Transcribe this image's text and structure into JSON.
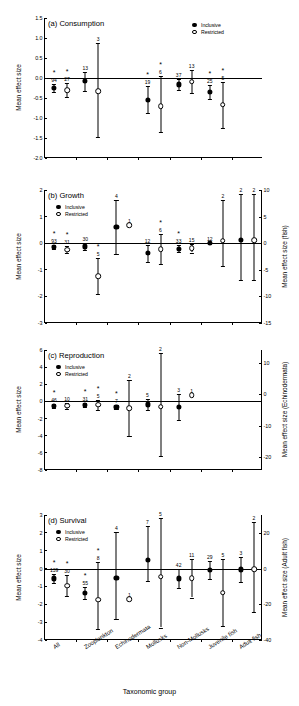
{
  "figure": {
    "xaxis_title": "Taxonomic group",
    "categories": [
      "All",
      "Zooplankton",
      "Echinodermata",
      "Mollusks",
      "Non-Mollusks",
      "Juvenile fish",
      "Adult fish"
    ],
    "legend": {
      "filled_label": "Inclusive",
      "open_label": "Restricted"
    },
    "left_axis_label": "Mean effect size",
    "significance_marker": "*"
  },
  "chart_data": [
    {
      "type": "scatter",
      "panel": "a",
      "title": "(a) Consumption",
      "ylabel": "Mean effect size",
      "xlabel": "",
      "ylim": [
        -2.0,
        1.5
      ],
      "yticks": [
        "1.5",
        "1.0",
        "0.5",
        "0.0",
        "-0.5",
        "-1.0",
        "-1.5",
        "-2.0"
      ],
      "ytick_values": [
        1.5,
        1.0,
        0.5,
        0.0,
        -0.5,
        -1.0,
        -1.5,
        -2.0
      ],
      "right_axis": null,
      "grid": false,
      "legend_position": "top-right",
      "categories": [
        "All",
        "Zooplankton",
        "Echinodermata",
        "Mollusks",
        "Non-Mollusks",
        "Juvenile fish",
        "Adult fish"
      ],
      "series": [
        {
          "name": "Inclusive",
          "marker": "filled",
          "points": [
            {
              "cat": "All",
              "value": -0.25,
              "low": -0.36,
              "high": -0.14,
              "n": "94",
              "sig": true
            },
            {
              "cat": "Zooplankton",
              "value": -0.08,
              "low": -0.33,
              "high": 0.16,
              "n": "13",
              "sig": false
            },
            {
              "cat": "Echinodermata",
              "value": null,
              "low": null,
              "high": null,
              "n": "",
              "sig": false
            },
            {
              "cat": "Mollusks",
              "value": -0.54,
              "low": -0.87,
              "high": -0.21,
              "n": "19",
              "sig": true
            },
            {
              "cat": "Non-Mollusks",
              "value": -0.16,
              "low": -0.3,
              "high": -0.02,
              "n": "37",
              "sig": false
            },
            {
              "cat": "Juvenile fish",
              "value": -0.35,
              "low": -0.53,
              "high": -0.17,
              "n": "25",
              "sig": true
            },
            {
              "cat": "Adult fish",
              "value": null,
              "low": null,
              "high": null,
              "n": "",
              "sig": false
            }
          ]
        },
        {
          "name": "Restricted",
          "marker": "open",
          "points": [
            {
              "cat": "All",
              "value": -0.3,
              "low": -0.48,
              "high": -0.12,
              "n": "27",
              "sig": true
            },
            {
              "cat": "Zooplankton",
              "value": -0.33,
              "low": -1.48,
              "high": 0.87,
              "n": "3",
              "sig": false
            },
            {
              "cat": "Echinodermata",
              "value": null,
              "low": null,
              "high": null,
              "n": "",
              "sig": false
            },
            {
              "cat": "Mollusks",
              "value": -0.7,
              "low": -1.36,
              "high": 0.04,
              "n": "6",
              "sig": true
            },
            {
              "cat": "Non-Mollusks",
              "value": -0.09,
              "low": -0.37,
              "high": 0.2,
              "n": "13",
              "sig": false
            },
            {
              "cat": "Juvenile fish",
              "value": -0.67,
              "low": -1.26,
              "high": -0.1,
              "n": "5",
              "sig": true
            },
            {
              "cat": "Adult fish",
              "value": null,
              "low": null,
              "high": null,
              "n": "",
              "sig": false
            }
          ]
        }
      ]
    },
    {
      "type": "scatter",
      "panel": "b",
      "title": "(b) Growth",
      "ylabel": "Mean effect size",
      "xlabel": "",
      "ylim": [
        -3,
        2
      ],
      "yticks": [
        "2",
        "1",
        "0",
        "-1",
        "-2",
        "-3"
      ],
      "ytick_values": [
        2,
        1,
        0,
        -1,
        -2,
        -3
      ],
      "right_axis": {
        "label": "Mean effect size (fish)",
        "ticks": [
          "10",
          "5",
          "0",
          "-5",
          "-10",
          "-15"
        ],
        "tick_values": [
          10,
          5,
          0,
          -5,
          -10,
          -15
        ],
        "lim": [
          -15,
          10
        ]
      },
      "grid": false,
      "legend_position": "top-left",
      "categories": [
        "All",
        "Zooplankton",
        "Echinodermata",
        "Mollusks",
        "Non-Mollusks",
        "Juvenile fish",
        "Adult fish"
      ],
      "series": [
        {
          "name": "Inclusive",
          "marker": "filled",
          "points": [
            {
              "cat": "All",
              "value": -0.13,
              "low": -0.21,
              "high": -0.05,
              "n": "93",
              "sig": true
            },
            {
              "cat": "Zooplankton",
              "value": -0.12,
              "low": -0.25,
              "high": 0.01,
              "n": "30",
              "sig": false
            },
            {
              "cat": "Echinodermata",
              "value": 0.62,
              "low": -0.4,
              "high": 1.64,
              "n": "4",
              "sig": false
            },
            {
              "cat": "Mollusks",
              "value": -0.38,
              "low": -0.71,
              "high": -0.05,
              "n": "12",
              "sig": false
            },
            {
              "cat": "Non-Mollusks",
              "value": -0.2,
              "low": -0.33,
              "high": -0.07,
              "n": "33",
              "sig": true
            },
            {
              "cat": "Juvenile fish",
              "value": 0.0,
              "low": 0.0,
              "high": 0.0,
              "n": "12",
              "sig": false
            },
            {
              "cat": "Adult fish",
              "value": 0.13,
              "low": -1.4,
              "high": 1.85,
              "n": "2",
              "sig": false
            }
          ]
        },
        {
          "name": "Restricted",
          "marker": "open",
          "points": [
            {
              "cat": "All",
              "value": -0.25,
              "low": -0.38,
              "high": -0.12,
              "n": "31",
              "sig": true
            },
            {
              "cat": "Zooplankton",
              "value": -1.24,
              "low": -1.9,
              "high": -0.55,
              "n": "5",
              "sig": true
            },
            {
              "cat": "Echinodermata",
              "value": 0.68,
              "low": 0.68,
              "high": 0.68,
              "n": "1",
              "sig": false
            },
            {
              "cat": "Mollusks",
              "value": -0.23,
              "low": -0.78,
              "high": 0.33,
              "n": "6",
              "sig": true
            },
            {
              "cat": "Non-Mollusks",
              "value": -0.18,
              "low": -0.35,
              "high": -0.02,
              "n": "15",
              "sig": false
            },
            {
              "cat": "Juvenile fish",
              "value": 0.1,
              "low": -0.85,
              "high": 1.62,
              "n": "2",
              "sig": false
            },
            {
              "cat": "Adult fish",
              "value": 0.12,
              "low": -1.4,
              "high": 1.85,
              "n": "2",
              "sig": false
            }
          ]
        }
      ]
    },
    {
      "type": "scatter",
      "panel": "c",
      "title": "(c) Reproduction",
      "ylabel": "Mean effect size",
      "xlabel": "",
      "ylim": [
        -8,
        6
      ],
      "yticks": [
        "6",
        "4",
        "2",
        "0",
        "-2",
        "-4",
        "-6",
        "-8"
      ],
      "ytick_values": [
        6,
        4,
        2,
        0,
        -2,
        -4,
        -6,
        -8
      ],
      "right_axis": {
        "label": "Mean effect size (Echinodermata)",
        "ticks": [
          "10",
          "0",
          "-10",
          "-20"
        ],
        "tick_values": [
          10,
          0,
          -10,
          -20
        ],
        "lim": [
          -24,
          14
        ]
      },
      "grid": false,
      "legend_position": "top-left",
      "categories": [
        "All",
        "Zooplankton",
        "Echinodermata",
        "Mollusks",
        "Non-Mollusks",
        "Juvenile fish",
        "Adult fish"
      ],
      "series": [
        {
          "name": "Inclusive",
          "marker": "filled",
          "points": [
            {
              "cat": "All",
              "value": -0.5,
              "low": -0.75,
              "high": -0.25,
              "n": "46",
              "sig": true
            },
            {
              "cat": "Zooplankton",
              "value": -0.45,
              "low": -0.7,
              "high": -0.2,
              "n": "31",
              "sig": true
            },
            {
              "cat": "Echinodermata",
              "value": -0.62,
              "low": -0.88,
              "high": -0.36,
              "n": "7",
              "sig": true
            },
            {
              "cat": "Mollusks",
              "value": -0.35,
              "low": -1.0,
              "high": 0.3,
              "n": "5",
              "sig": false
            },
            {
              "cat": "Non-Mollusks",
              "value": -0.65,
              "low": -2.2,
              "high": 0.9,
              "n": "3",
              "sig": false
            },
            {
              "cat": "Juvenile fish",
              "value": null,
              "low": null,
              "high": null,
              "n": "",
              "sig": false
            },
            {
              "cat": "Adult fish",
              "value": null,
              "low": null,
              "high": null,
              "n": "",
              "sig": false
            }
          ]
        },
        {
          "name": "Restricted",
          "marker": "open",
          "points": [
            {
              "cat": "All",
              "value": -0.5,
              "low": -0.85,
              "high": -0.15,
              "n": "10",
              "sig": false
            },
            {
              "cat": "Zooplankton",
              "value": -0.4,
              "low": -1.0,
              "high": 0.2,
              "n": "5",
              "sig": true
            },
            {
              "cat": "Echinodermata",
              "value": -0.82,
              "low": -4.05,
              "high": 2.45,
              "n": "2",
              "sig": false
            },
            {
              "cat": "Mollusks",
              "value": -0.6,
              "low": -6.35,
              "high": 5.6,
              "n": "2",
              "sig": false
            },
            {
              "cat": "Non-Mollusks",
              "value": 0.75,
              "low": 0.75,
              "high": 0.75,
              "n": "1",
              "sig": false
            },
            {
              "cat": "Juvenile fish",
              "value": null,
              "low": null,
              "high": null,
              "n": "",
              "sig": false
            },
            {
              "cat": "Adult fish",
              "value": null,
              "low": null,
              "high": null,
              "n": "",
              "sig": false
            }
          ]
        }
      ]
    },
    {
      "type": "scatter",
      "panel": "d",
      "title": "(d) Survival",
      "ylabel": "Mean effect size",
      "xlabel": "Taxonomic group",
      "ylim": [
        -4,
        3
      ],
      "yticks": [
        "3",
        "2",
        "1",
        "0",
        "-1",
        "-2",
        "-3",
        "-4"
      ],
      "ytick_values": [
        3,
        2,
        1,
        0,
        -1,
        -2,
        -3,
        -4
      ],
      "right_axis": {
        "label": "Mean effect size (Adult fish)",
        "ticks": [
          "20",
          "0",
          "-20",
          "-40"
        ],
        "tick_values": [
          20,
          0,
          -20,
          -40
        ],
        "lim": [
          -40,
          30
        ]
      },
      "grid": false,
      "legend_position": "top-left",
      "categories": [
        "All",
        "Zooplankton",
        "Echinodermata",
        "Mollusks",
        "Non-Mollusks",
        "Juvenile fish",
        "Adult fish"
      ],
      "series": [
        {
          "name": "Inclusive",
          "marker": "filled",
          "points": [
            {
              "cat": "All",
              "value": -0.55,
              "low": -0.82,
              "high": -0.28,
              "n": "139",
              "sig": true
            },
            {
              "cat": "Zooplankton",
              "value": -1.37,
              "low": -1.72,
              "high": -1.02,
              "n": "55",
              "sig": true
            },
            {
              "cat": "Echinodermata",
              "value": -0.52,
              "low": -2.83,
              "high": 2.05,
              "n": "4",
              "sig": false
            },
            {
              "cat": "Mollusks",
              "value": 0.48,
              "low": -0.68,
              "high": 2.4,
              "n": "7",
              "sig": false
            },
            {
              "cat": "Non-Mollusks",
              "value": -0.55,
              "low": -1.1,
              "high": 0.0,
              "n": "42",
              "sig": false
            },
            {
              "cat": "Juvenile fish",
              "value": -0.08,
              "low": -0.58,
              "high": 0.42,
              "n": "29",
              "sig": false
            },
            {
              "cat": "Adult fish",
              "value": -0.05,
              "low": -0.75,
              "high": 0.65,
              "n": "3",
              "sig": false
            }
          ]
        },
        {
          "name": "Restricted",
          "marker": "open",
          "points": [
            {
              "cat": "All",
              "value": -0.95,
              "low": -1.55,
              "high": -0.35,
              "n": "30",
              "sig": true
            },
            {
              "cat": "Zooplankton",
              "value": -1.75,
              "low": -3.38,
              "high": 0.35,
              "n": "8",
              "sig": true
            },
            {
              "cat": "Echinodermata",
              "value": -1.72,
              "low": -1.72,
              "high": -1.72,
              "n": "1",
              "sig": false
            },
            {
              "cat": "Mollusks",
              "value": -0.45,
              "low": -3.3,
              "high": 2.82,
              "n": "5",
              "sig": false
            },
            {
              "cat": "Non-Mollusks",
              "value": -0.55,
              "low": -1.62,
              "high": 0.52,
              "n": "11",
              "sig": false
            },
            {
              "cat": "Juvenile fish",
              "value": -1.35,
              "low": -3.2,
              "high": 0.55,
              "n": "5",
              "sig": false
            },
            {
              "cat": "Adult fish",
              "value": -0.02,
              "low": -2.42,
              "high": 2.6,
              "n": "2",
              "sig": false
            }
          ]
        }
      ]
    }
  ]
}
